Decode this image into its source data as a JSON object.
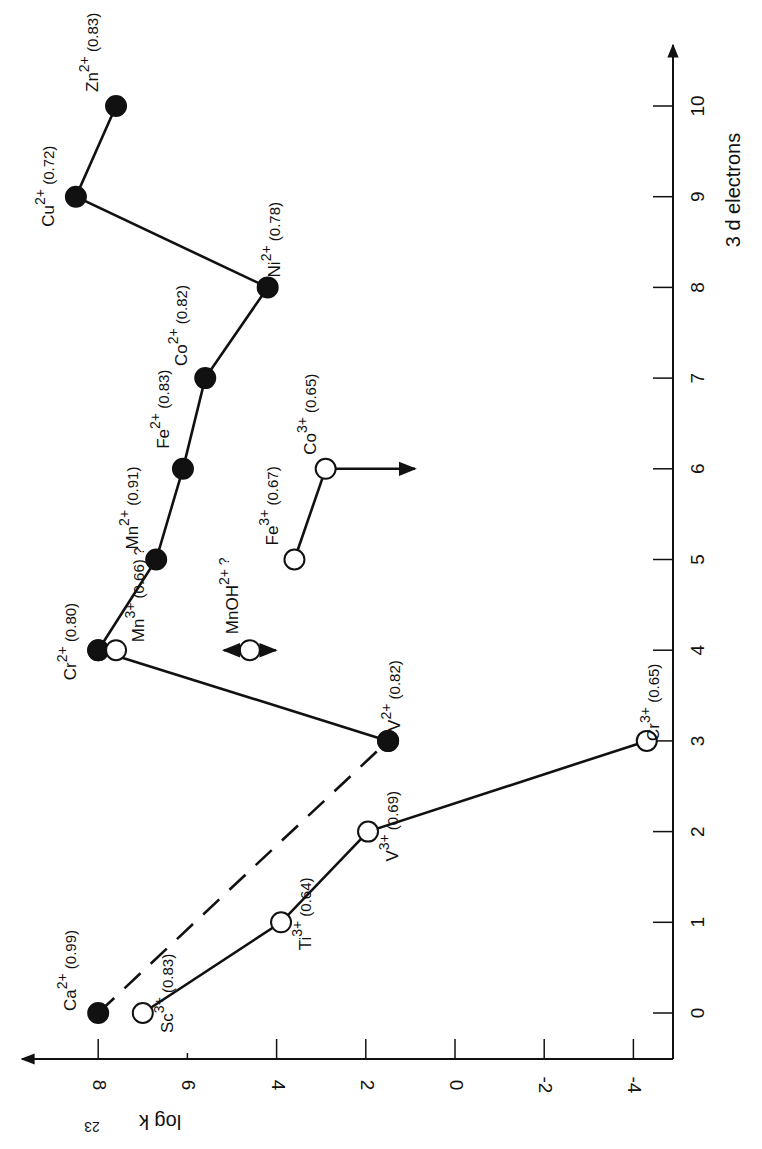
{
  "chart_data": {
    "type": "line",
    "orientation": "rotated-90-cw",
    "title": "",
    "xlabel": "3 d electrons",
    "ylabel": "log k23",
    "xlim": [
      0,
      10
    ],
    "ylim": [
      -4,
      8
    ],
    "x_ticks": [
      "0",
      "1",
      "2",
      "3",
      "4",
      "5",
      "6",
      "7",
      "8",
      "9",
      "10"
    ],
    "y_ticks": [
      "8",
      "6",
      "4",
      "2",
      "0",
      "-2",
      "-4"
    ],
    "grid": false,
    "series": [
      {
        "name": "M2+ ions",
        "marker": "filled",
        "line": "solid",
        "points": [
          {
            "ion": "Cr",
            "charge": "2+",
            "radius": "(0.80)",
            "x": 4,
            "y": 8.0
          },
          {
            "ion": "Mn",
            "charge": "2+",
            "radius": "(0.91)",
            "x": 5,
            "y": 6.7
          },
          {
            "ion": "Fe",
            "charge": "2+",
            "radius": "(0.83)",
            "x": 6,
            "y": 6.1
          },
          {
            "ion": "Co",
            "charge": "2+",
            "radius": "(0.82)",
            "x": 7,
            "y": 5.6
          },
          {
            "ion": "Ni",
            "charge": "2+",
            "radius": "(0.78)",
            "x": 8,
            "y": 4.2
          },
          {
            "ion": "Cu",
            "charge": "2+",
            "radius": "(0.72)",
            "x": 9,
            "y": 8.5
          },
          {
            "ion": "Zn",
            "charge": "2+",
            "radius": "(0.83)",
            "x": 10,
            "y": 7.6
          }
        ]
      },
      {
        "name": "V2+ to Cr2+",
        "marker": "filled",
        "line": "solid",
        "points": [
          {
            "ion": "V",
            "charge": "2+",
            "radius": "(0.82)",
            "x": 3,
            "y": 1.5
          },
          {
            "ion": "Cr",
            "charge": "2+",
            "radius": "",
            "x": 4,
            "y": 8.0
          }
        ]
      },
      {
        "name": "Ca2+ to V2+ (interpolated)",
        "marker": "filled",
        "line": "dashed",
        "points": [
          {
            "ion": "Ca",
            "charge": "2+",
            "radius": "(0.99)",
            "x": 0,
            "y": 8.0
          },
          {
            "ion": "V",
            "charge": "2+",
            "radius": "",
            "x": 3,
            "y": 1.5
          }
        ]
      },
      {
        "name": "M3+ ions",
        "marker": "open",
        "line": "solid",
        "points": [
          {
            "ion": "Sc",
            "charge": "3+",
            "radius": "(0.83)",
            "x": 0,
            "y": 7.0
          },
          {
            "ion": "Ti",
            "charge": "3+",
            "radius": "(0.64)",
            "x": 1,
            "y": 3.9
          },
          {
            "ion": "V",
            "charge": "3+",
            "radius": "(0.69)",
            "x": 2,
            "y": 1.95
          },
          {
            "ion": "Cr",
            "charge": "3+",
            "radius": "(0.65)",
            "x": 3,
            "y": -4.3
          }
        ]
      },
      {
        "name": "Fe3+ / Co3+",
        "marker": "open",
        "line": "solid",
        "points": [
          {
            "ion": "Fe",
            "charge": "3+",
            "radius": "(0.67)",
            "x": 5,
            "y": 3.6
          },
          {
            "ion": "Co",
            "charge": "3+",
            "radius": "(0.65)",
            "x": 6,
            "y": 2.9
          }
        ],
        "annotation": "arrow from Co3+ toward lower log k (upper limit)"
      },
      {
        "name": "Uncertain Mn species",
        "marker": "open",
        "line": "none",
        "points": [
          {
            "ion": "Mn",
            "charge": "3+",
            "radius": "(0.66)",
            "note": "?",
            "x": 4,
            "y": 7.6
          },
          {
            "ion": "MnOH",
            "charge": "2+",
            "radius": "",
            "note": "?",
            "x": 4,
            "y": 4.6
          }
        ],
        "annotation": "MnOH2+ has double-headed arrow (uncertain value)"
      }
    ]
  }
}
